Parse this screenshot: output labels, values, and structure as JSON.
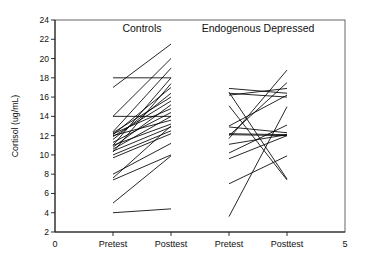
{
  "figure": {
    "background_color": "#ffffff",
    "line_color": "#000000",
    "axis_color": "#1a1a1a",
    "frame_color": "#555555"
  },
  "axes": {
    "y_title": "Cortisol (ug/mL)",
    "y_ticks": [
      "2",
      "4",
      "6",
      "8",
      "10",
      "12",
      "14",
      "16",
      "18",
      "20",
      "22",
      "24"
    ],
    "x_ticks": [
      "Pretest",
      "Posttest",
      "Pretest",
      "Posttest"
    ],
    "x_origin_label": "0",
    "x_end_label": "5"
  },
  "groups": [
    {
      "title": "Controls"
    },
    {
      "title": "Endogenous Depressed"
    }
  ],
  "chart_data": {
    "type": "line",
    "title": "",
    "subtitle": "",
    "xlabel": "",
    "ylabel": "Cortisol (ug/mL)",
    "ylim": [
      2,
      24
    ],
    "ytick_step": 2,
    "xlim": [
      0,
      5
    ],
    "xtick_values": [
      1,
      2,
      3,
      4
    ],
    "xtick_labels": [
      "Pretest",
      "Posttest",
      "Pretest",
      "Posttest"
    ],
    "grid": false,
    "legend": "none",
    "annotations": [
      "Controls",
      "Endogenous Depressed"
    ],
    "series": [
      {
        "name": "Controls",
        "x": [
          1,
          2
        ],
        "pairs": [
          [
            17.0,
            21.5
          ],
          [
            18.0,
            18.0
          ],
          [
            14.0,
            20.0
          ],
          [
            12.4,
            19.0
          ],
          [
            11.0,
            18.0
          ],
          [
            10.3,
            17.4
          ],
          [
            14.0,
            14.0
          ],
          [
            12.1,
            17.0
          ],
          [
            11.6,
            16.4
          ],
          [
            12.3,
            16.0
          ],
          [
            11.9,
            15.6
          ],
          [
            10.8,
            15.2
          ],
          [
            12.2,
            14.8
          ],
          [
            11.3,
            14.4
          ],
          [
            10.6,
            14.0
          ],
          [
            12.0,
            13.6
          ],
          [
            11.0,
            13.2
          ],
          [
            10.4,
            12.9
          ],
          [
            10.0,
            12.5
          ],
          [
            9.7,
            12.2
          ],
          [
            7.6,
            13.0
          ],
          [
            8.0,
            11.2
          ],
          [
            7.4,
            10.0
          ],
          [
            5.0,
            9.9
          ],
          [
            4.0,
            4.4
          ]
        ]
      },
      {
        "name": "Endogenous Depressed",
        "x": [
          3,
          4
        ],
        "pairs": [
          [
            11.7,
            18.8
          ],
          [
            12.0,
            17.5
          ],
          [
            16.2,
            16.9
          ],
          [
            16.9,
            16.4
          ],
          [
            16.4,
            16.0
          ],
          [
            13.0,
            16.2
          ],
          [
            12.9,
            12.3
          ],
          [
            16.5,
            7.5
          ],
          [
            15.1,
            7.4
          ],
          [
            12.2,
            12.1
          ],
          [
            12.1,
            12.0
          ],
          [
            11.1,
            12.1
          ],
          [
            10.2,
            13.1
          ],
          [
            9.6,
            12.0
          ],
          [
            7.0,
            9.9
          ],
          [
            3.6,
            15.0
          ]
        ]
      }
    ]
  }
}
